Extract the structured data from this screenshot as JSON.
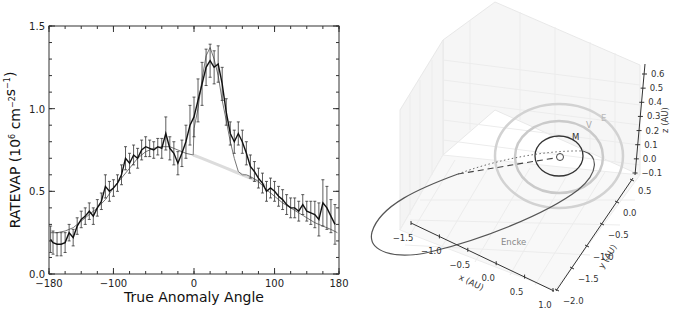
{
  "chart_data": [
    {
      "type": "line",
      "title": "",
      "xlabel": "True Anomaly Angle",
      "ylabel": "RATEVAP (10^6 cm^-2 s^-1)",
      "xlim": [
        -180,
        180
      ],
      "ylim": [
        0.0,
        1.5
      ],
      "x_ticks": [
        "-180",
        "-100",
        "0",
        "100",
        "180"
      ],
      "y_ticks": [
        "0.0",
        "0.5",
        "1.0",
        "1.5"
      ],
      "grid": false,
      "legend": null,
      "series": [
        {
          "name": "observed",
          "style": "black line with error bars",
          "x": [
            -178,
            -175,
            -170,
            -165,
            -160,
            -155,
            -150,
            -145,
            -140,
            -135,
            -130,
            -125,
            -120,
            -115,
            -110,
            -105,
            -100,
            -95,
            -90,
            -85,
            -80,
            -75,
            -70,
            -65,
            -60,
            -55,
            -50,
            -45,
            -40,
            -35,
            -30,
            -25,
            -20,
            -15,
            -10,
            -5,
            0,
            5,
            10,
            15,
            20,
            25,
            30,
            35,
            40,
            45,
            50,
            55,
            60,
            65,
            70,
            75,
            80,
            85,
            90,
            95,
            100,
            105,
            110,
            115,
            120,
            125,
            130,
            135,
            140,
            145,
            150,
            155,
            160,
            165,
            170,
            175
          ],
          "y": [
            0.21,
            0.19,
            0.18,
            0.18,
            0.19,
            0.25,
            0.22,
            0.29,
            0.33,
            0.35,
            0.38,
            0.35,
            0.4,
            0.44,
            0.53,
            0.5,
            0.52,
            0.55,
            0.6,
            0.7,
            0.67,
            0.72,
            0.7,
            0.75,
            0.77,
            0.76,
            0.75,
            0.77,
            0.76,
            0.85,
            0.76,
            0.73,
            0.67,
            0.73,
            0.8,
            0.9,
            0.95,
            1.05,
            1.15,
            1.25,
            1.29,
            1.25,
            1.27,
            1.15,
            0.98,
            0.85,
            0.8,
            0.85,
            0.8,
            0.73,
            0.65,
            0.62,
            0.58,
            0.55,
            0.5,
            0.52,
            0.5,
            0.47,
            0.45,
            0.42,
            0.4,
            0.4,
            0.38,
            0.42,
            0.38,
            0.37,
            0.36,
            0.33,
            0.43,
            0.4,
            0.35,
            0.3
          ],
          "error": [
            0.08,
            0.07,
            0.07,
            0.07,
            0.06,
            0.05,
            0.05,
            0.05,
            0.05,
            0.05,
            0.05,
            0.05,
            0.05,
            0.05,
            0.07,
            0.06,
            0.05,
            0.05,
            0.06,
            0.07,
            0.06,
            0.06,
            0.06,
            0.06,
            0.06,
            0.05,
            0.05,
            0.05,
            0.06,
            0.1,
            0.07,
            0.07,
            0.07,
            0.08,
            0.1,
            0.12,
            0.12,
            0.13,
            0.13,
            0.11,
            0.1,
            0.1,
            0.11,
            0.1,
            0.08,
            0.07,
            0.07,
            0.07,
            0.07,
            0.07,
            0.07,
            0.06,
            0.06,
            0.06,
            0.06,
            0.06,
            0.06,
            0.06,
            0.06,
            0.06,
            0.06,
            0.06,
            0.06,
            0.06,
            0.06,
            0.07,
            0.08,
            0.1,
            0.14,
            0.13,
            0.1,
            0.12
          ]
        },
        {
          "name": "model",
          "style": "thin gray line",
          "x": [
            -178,
            -170,
            -160,
            -150,
            -140,
            -130,
            -120,
            -110,
            -100,
            -90,
            -80,
            -70,
            -60,
            -50,
            -40,
            -30,
            -20,
            -10,
            -1,
            0,
            5,
            10,
            15,
            20,
            25,
            30,
            35,
            40,
            45,
            50,
            55,
            60,
            65,
            70,
            80,
            90,
            100,
            110,
            120,
            130,
            140,
            150,
            160,
            170,
            178
          ],
          "y": [
            0.25,
            0.25,
            0.26,
            0.28,
            0.32,
            0.36,
            0.4,
            0.45,
            0.52,
            0.58,
            0.64,
            0.7,
            0.74,
            0.76,
            0.77,
            0.77,
            0.75,
            0.73,
            0.72,
            0.88,
            1.0,
            1.18,
            1.32,
            1.37,
            1.3,
            1.2,
            1.05,
            0.93,
            0.8,
            0.7,
            0.62,
            0.6,
            0.6,
            0.59,
            0.56,
            0.51,
            0.47,
            0.43,
            0.4,
            0.37,
            0.34,
            0.31,
            0.29,
            0.27,
            0.25
          ]
        },
        {
          "name": "baseline (no outburst)",
          "style": "light gray line",
          "x": [
            -1,
            10,
            20,
            30,
            40,
            50,
            60,
            70,
            80,
            90
          ],
          "y": [
            0.72,
            0.7,
            0.68,
            0.66,
            0.64,
            0.62,
            0.6,
            0.58,
            0.56,
            0.53
          ]
        }
      ]
    },
    {
      "type": "line",
      "subtype": "3d-orbit-plot",
      "title": "",
      "xlabel": "x (AU)",
      "ylabel": "y (AU)",
      "zlabel": "z (AU)",
      "x_ticks": [
        "-1.5",
        "-1.0",
        "-0.5",
        "0.0",
        "0.5",
        "1.0"
      ],
      "y_ticks": [
        "-2.0",
        "-1.5",
        "-1.0",
        "-0.5",
        "0.0",
        "0.5"
      ],
      "z_ticks": [
        "-0.1",
        "0.0",
        "0.1",
        "0.2",
        "0.3",
        "0.4",
        "0.5",
        "0.6"
      ],
      "grid": true,
      "annotations": [
        "M",
        "V",
        "E",
        "Encke"
      ],
      "series": [
        {
          "name": "Mercury orbit",
          "label": "M",
          "color": "#333333"
        },
        {
          "name": "Venus orbit",
          "label": "V",
          "color": "#cccccc"
        },
        {
          "name": "Earth orbit",
          "label": "E",
          "color": "#d0d0d0"
        },
        {
          "name": "Comet Encke orbit",
          "label": "Encke",
          "color": "#555555"
        },
        {
          "name": "Sun",
          "marker": "circle",
          "color": "#444444"
        }
      ]
    }
  ]
}
